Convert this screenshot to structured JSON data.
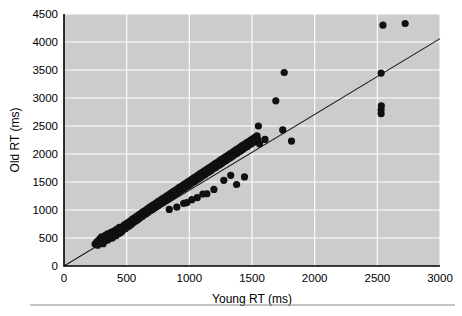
{
  "chart_data": {
    "type": "scatter",
    "title": "",
    "xlabel": "Young RT (ms)",
    "ylabel": "Old RT (ms)",
    "xlim": [
      0,
      3000
    ],
    "ylim": [
      0,
      4500
    ],
    "xticks": [
      0,
      500,
      1000,
      1500,
      2000,
      2500,
      3000
    ],
    "yticks": [
      0,
      500,
      1000,
      1500,
      2000,
      2500,
      3000,
      3500,
      4000,
      4500
    ],
    "xtick_labels": [
      "0",
      "500",
      "1000",
      "1500",
      "2000",
      "2500",
      "3000"
    ],
    "ytick_labels": [
      "0",
      "500",
      "1000",
      "1500",
      "2000",
      "2500",
      "3000",
      "3500",
      "4000",
      "4500"
    ],
    "grid": true,
    "grid_color": "#ffffff",
    "panel_color": "#cccccc",
    "marker_color": "#101010",
    "marker_size_px": 4.6,
    "legend": null,
    "legend_position": "none",
    "fit_line": {
      "label": "regression line through origin",
      "color": "#1a1a1a",
      "x": [
        0,
        3000
      ],
      "y": [
        0,
        4060
      ],
      "slope": 1.3533,
      "intercept": 0
    },
    "series": [
      {
        "name": "participants",
        "n_points": 238,
        "points": [
          [
            248,
            392
          ],
          [
            262,
            430
          ],
          [
            268,
            372
          ],
          [
            275,
            455
          ],
          [
            283,
            410
          ],
          [
            288,
            489
          ],
          [
            295,
            437
          ],
          [
            300,
            520
          ],
          [
            305,
            466
          ],
          [
            312,
            398
          ],
          [
            318,
            512
          ],
          [
            325,
            470
          ],
          [
            330,
            548
          ],
          [
            336,
            500
          ],
          [
            342,
            455
          ],
          [
            348,
            575
          ],
          [
            353,
            518
          ],
          [
            358,
            482
          ],
          [
            364,
            560
          ],
          [
            370,
            530
          ],
          [
            375,
            600
          ],
          [
            381,
            545
          ],
          [
            386,
            498
          ],
          [
            392,
            585
          ],
          [
            398,
            625
          ],
          [
            403,
            562
          ],
          [
            409,
            610
          ],
          [
            415,
            540
          ],
          [
            420,
            655
          ],
          [
            426,
            598
          ],
          [
            431,
            640
          ],
          [
            437,
            578
          ],
          [
            442,
            690
          ],
          [
            448,
            620
          ],
          [
            454,
            660
          ],
          [
            459,
            605
          ],
          [
            465,
            700
          ],
          [
            470,
            648
          ],
          [
            476,
            690
          ],
          [
            482,
            735
          ],
          [
            487,
            662
          ],
          [
            493,
            712
          ],
          [
            498,
            755
          ],
          [
            504,
            690
          ],
          [
            510,
            740
          ],
          [
            515,
            782
          ],
          [
            521,
            715
          ],
          [
            526,
            768
          ],
          [
            532,
            810
          ],
          [
            538,
            745
          ],
          [
            543,
            795
          ],
          [
            549,
            840
          ],
          [
            554,
            775
          ],
          [
            560,
            822
          ],
          [
            566,
            865
          ],
          [
            571,
            800
          ],
          [
            577,
            850
          ],
          [
            582,
            890
          ],
          [
            588,
            825
          ],
          [
            594,
            875
          ],
          [
            599,
            918
          ],
          [
            605,
            855
          ],
          [
            610,
            905
          ],
          [
            616,
            945
          ],
          [
            622,
            880
          ],
          [
            627,
            930
          ],
          [
            633,
            970
          ],
          [
            638,
            910
          ],
          [
            644,
            955
          ],
          [
            650,
            995
          ],
          [
            655,
            935
          ],
          [
            661,
            980
          ],
          [
            666,
            1020
          ],
          [
            672,
            960
          ],
          [
            678,
            1005
          ],
          [
            683,
            1048
          ],
          [
            689,
            985
          ],
          [
            694,
            1030
          ],
          [
            700,
            1072
          ],
          [
            706,
            1010
          ],
          [
            711,
            1055
          ],
          [
            717,
            1098
          ],
          [
            722,
            1035
          ],
          [
            728,
            1080
          ],
          [
            734,
            1122
          ],
          [
            739,
            1060
          ],
          [
            745,
            1105
          ],
          [
            750,
            1148
          ],
          [
            756,
            1085
          ],
          [
            762,
            1130
          ],
          [
            767,
            1172
          ],
          [
            773,
            1110
          ],
          [
            778,
            1155
          ],
          [
            784,
            1198
          ],
          [
            790,
            1135
          ],
          [
            795,
            1180
          ],
          [
            801,
            1222
          ],
          [
            806,
            1160
          ],
          [
            812,
            1205
          ],
          [
            818,
            1248
          ],
          [
            823,
            1185
          ],
          [
            829,
            1230
          ],
          [
            834,
            1272
          ],
          [
            840,
            1210
          ],
          [
            846,
            1255
          ],
          [
            851,
            1298
          ],
          [
            857,
            1235
          ],
          [
            862,
            1280
          ],
          [
            868,
            1322
          ],
          [
            874,
            1260
          ],
          [
            879,
            1305
          ],
          [
            885,
            1348
          ],
          [
            890,
            1285
          ],
          [
            896,
            1330
          ],
          [
            902,
            1372
          ],
          [
            907,
            1310
          ],
          [
            913,
            1355
          ],
          [
            918,
            1398
          ],
          [
            924,
            1335
          ],
          [
            930,
            1380
          ],
          [
            935,
            1422
          ],
          [
            941,
            1360
          ],
          [
            946,
            1405
          ],
          [
            952,
            1448
          ],
          [
            958,
            1385
          ],
          [
            963,
            1430
          ],
          [
            969,
            1472
          ],
          [
            974,
            1410
          ],
          [
            980,
            1455
          ],
          [
            986,
            1498
          ],
          [
            991,
            1435
          ],
          [
            997,
            1480
          ],
          [
            1002,
            1522
          ],
          [
            1008,
            1460
          ],
          [
            1014,
            1505
          ],
          [
            1019,
            1548
          ],
          [
            1025,
            1485
          ],
          [
            1030,
            1530
          ],
          [
            1036,
            1572
          ],
          [
            1042,
            1510
          ],
          [
            1047,
            1555
          ],
          [
            1053,
            1598
          ],
          [
            1058,
            1535
          ],
          [
            1064,
            1580
          ],
          [
            1070,
            1622
          ],
          [
            1075,
            1560
          ],
          [
            1081,
            1605
          ],
          [
            1086,
            1648
          ],
          [
            1092,
            1585
          ],
          [
            1098,
            1630
          ],
          [
            1103,
            1672
          ],
          [
            1109,
            1610
          ],
          [
            1114,
            1655
          ],
          [
            1120,
            1698
          ],
          [
            1126,
            1635
          ],
          [
            1131,
            1680
          ],
          [
            1137,
            1722
          ],
          [
            1142,
            1660
          ],
          [
            1148,
            1705
          ],
          [
            1154,
            1748
          ],
          [
            1159,
            1685
          ],
          [
            1165,
            1730
          ],
          [
            1170,
            1772
          ],
          [
            1176,
            1710
          ],
          [
            1182,
            1755
          ],
          [
            1187,
            1798
          ],
          [
            1193,
            1735
          ],
          [
            1198,
            1780
          ],
          [
            1204,
            1822
          ],
          [
            1210,
            1760
          ],
          [
            1215,
            1805
          ],
          [
            1221,
            1848
          ],
          [
            1226,
            1785
          ],
          [
            1232,
            1830
          ],
          [
            1238,
            1872
          ],
          [
            1243,
            1810
          ],
          [
            1249,
            1855
          ],
          [
            1254,
            1898
          ],
          [
            1260,
            1835
          ],
          [
            1266,
            1880
          ],
          [
            1271,
            1922
          ],
          [
            1277,
            1860
          ],
          [
            1282,
            1905
          ],
          [
            1288,
            1948
          ],
          [
            1294,
            1885
          ],
          [
            1299,
            1930
          ],
          [
            1305,
            1972
          ],
          [
            1310,
            1910
          ],
          [
            1316,
            1955
          ],
          [
            1322,
            1998
          ],
          [
            1327,
            1935
          ],
          [
            1333,
            1980
          ],
          [
            1338,
            2022
          ],
          [
            1344,
            1960
          ],
          [
            1350,
            2005
          ],
          [
            1355,
            2048
          ],
          [
            1361,
            1985
          ],
          [
            1366,
            2030
          ],
          [
            1372,
            2072
          ],
          [
            1378,
            2010
          ],
          [
            1383,
            2055
          ],
          [
            1389,
            2098
          ],
          [
            1394,
            2035
          ],
          [
            1400,
            2080
          ],
          [
            1406,
            2122
          ],
          [
            1411,
            2060
          ],
          [
            1417,
            2105
          ],
          [
            1422,
            2148
          ],
          [
            1428,
            2085
          ],
          [
            1434,
            2130
          ],
          [
            1439,
            2172
          ],
          [
            1445,
            2110
          ],
          [
            1450,
            2155
          ],
          [
            1456,
            2198
          ],
          [
            1462,
            2135
          ],
          [
            1467,
            2180
          ],
          [
            1473,
            2222
          ],
          [
            1478,
            2160
          ],
          [
            1484,
            2205
          ],
          [
            1490,
            2248
          ],
          [
            1495,
            2185
          ],
          [
            1501,
            2230
          ],
          [
            1506,
            2272
          ],
          [
            1512,
            2210
          ],
          [
            1518,
            2255
          ],
          [
            1523,
            2298
          ],
          [
            1529,
            2235
          ],
          [
            1534,
            2280
          ],
          [
            1540,
            2322
          ],
          [
            1546,
            2260
          ],
          [
            1551,
            2500
          ],
          [
            1560,
            2185
          ],
          [
            1604,
            2260
          ],
          [
            1690,
            2950
          ],
          [
            1757,
            3455
          ],
          [
            1745,
            2430
          ],
          [
            1815,
            2230
          ],
          [
            1377,
            1455
          ],
          [
            1440,
            1590
          ],
          [
            1196,
            1368
          ],
          [
            1140,
            1290
          ],
          [
            1063,
            1220
          ],
          [
            980,
            1130
          ],
          [
            900,
            1050
          ],
          [
            840,
            1010
          ],
          [
            1275,
            1530
          ],
          [
            1330,
            1620
          ],
          [
            1108,
            1285
          ],
          [
            1020,
            1185
          ],
          [
            955,
            1120
          ],
          [
            2530,
            2720
          ],
          [
            2530,
            2790
          ],
          [
            2532,
            2860
          ],
          [
            2530,
            3445
          ],
          [
            2545,
            4300
          ],
          [
            2722,
            4330
          ]
        ]
      }
    ]
  },
  "figure": {
    "footer_rule": true
  }
}
